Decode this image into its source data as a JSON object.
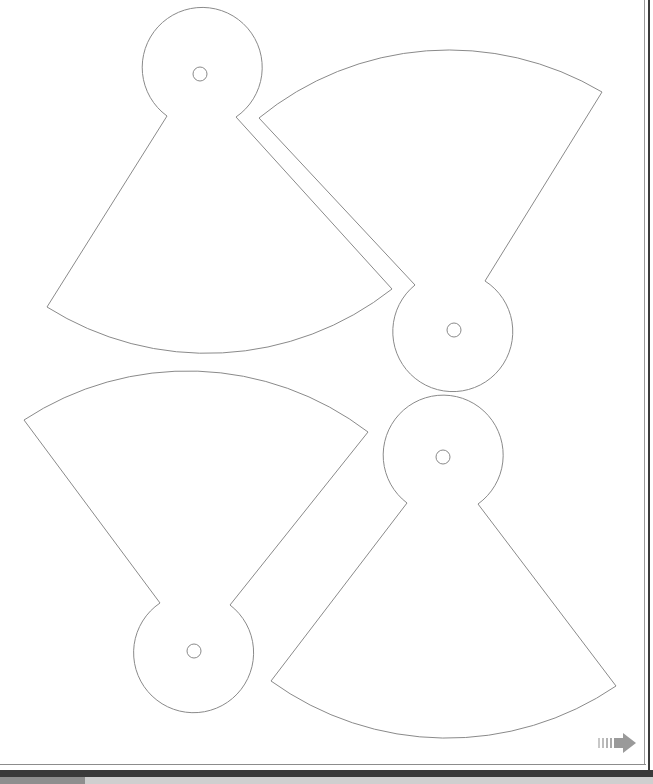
{
  "document": {
    "type": "printable cutout template",
    "background": "#ffffff",
    "stroke_color": "#8a8a8a"
  },
  "pieces": [
    {
      "id": "piece-top-left",
      "orientation": "down",
      "circle": {
        "cx": 200,
        "cy": 74,
        "r": 60
      },
      "hole": {
        "cx": 200,
        "cy": 74,
        "r": 7
      },
      "notch_left": [
        167,
        116
      ],
      "notch_right": [
        236,
        117
      ],
      "corner_left": [
        47,
        307
      ],
      "corner_right": [
        392,
        289
      ],
      "arc_mid": [
        220,
        353
      ]
    },
    {
      "id": "piece-top-right",
      "orientation": "up",
      "circle": {
        "cx": 454,
        "cy": 330,
        "r": 60
      },
      "hole": {
        "cx": 454,
        "cy": 330,
        "r": 7
      },
      "notch_left": [
        415,
        285
      ],
      "notch_right": [
        485,
        281
      ],
      "corner_left": [
        259,
        118
      ],
      "corner_right": [
        602,
        92
      ],
      "arc_mid": [
        452,
        50
      ]
    },
    {
      "id": "piece-bottom-left",
      "orientation": "up",
      "circle": {
        "cx": 194,
        "cy": 651,
        "r": 60
      },
      "hole": {
        "cx": 194,
        "cy": 651,
        "r": 7
      },
      "notch_left": [
        160,
        603
      ],
      "notch_right": [
        230,
        605
      ],
      "corner_left": [
        24,
        420
      ],
      "corner_right": [
        368,
        432
      ],
      "arc_mid": [
        190,
        371
      ]
    },
    {
      "id": "piece-bottom-right",
      "orientation": "down",
      "circle": {
        "cx": 443,
        "cy": 457,
        "r": 60
      },
      "hole": {
        "cx": 443,
        "cy": 457,
        "r": 7
      },
      "notch_left": [
        407,
        503
      ],
      "notch_right": [
        478,
        504
      ],
      "corner_left": [
        271,
        681
      ],
      "corner_right": [
        616,
        686
      ],
      "arc_mid": [
        440,
        738
      ]
    }
  ],
  "navigation": {
    "next_arrow": {
      "icon": "striped-right-arrow-icon",
      "color": "#9a9a9a"
    }
  },
  "frame": {
    "dark_band_color": "#3a3a3a",
    "lower_band_left_color": "#8e8e8e",
    "lower_band_right_color": "#cfcfcf"
  }
}
